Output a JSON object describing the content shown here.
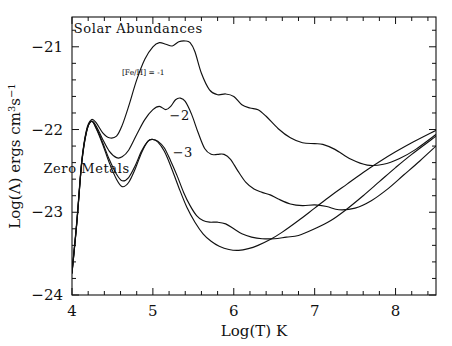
{
  "figure": {
    "title": "",
    "background": "#ffffff",
    "line_color": "#111111"
  },
  "axes": {
    "x": {
      "label": "Log(T)  K",
      "min": 4.0,
      "max": 8.5,
      "major_ticks": [
        4,
        5,
        6,
        7,
        8
      ],
      "tick_labels": [
        "4",
        "5",
        "6",
        "7",
        "8"
      ],
      "minor_tick_step": 0.2
    },
    "y": {
      "label_parts": {
        "prefix": "Log(",
        "lambda": "Λ",
        "middle": ") ergs cm",
        "sup1": "3",
        "s": "s",
        "sup2": "−1"
      },
      "label_plain": "Log(Λ) ergs cm3s−1",
      "min": -24.0,
      "max": -20.64,
      "major_ticks": [
        -21,
        -22,
        -23,
        -24
      ],
      "tick_labels": [
        "−21",
        "−22",
        "−23",
        "−24"
      ],
      "minor_tick_step": 0.2
    }
  },
  "annotations": [
    {
      "name": "solar-abundances-label",
      "text": "Solar Abundances",
      "x": 4.82,
      "y": -20.83,
      "size": 13
    },
    {
      "name": "feh-minus1-label",
      "text": "[Fe/H] = -1",
      "x": 4.88,
      "y": -21.34,
      "size": 7.5
    },
    {
      "name": "curve-label-minus2",
      "text": "−2",
      "x": 5.33,
      "y": -21.88,
      "size": 13
    },
    {
      "name": "curve-label-minus3",
      "text": "−3",
      "x": 5.37,
      "y": -22.33,
      "size": 13
    },
    {
      "name": "zero-metals-label",
      "text": "Zero Metals",
      "x": 4.18,
      "y": -22.52,
      "size": 13
    }
  ],
  "chart_data": {
    "type": "line",
    "title": "",
    "xlabel": "Log(T)  K",
    "ylabel": "Log(Λ) ergs cm3s−1",
    "xlim": [
      4.0,
      8.5
    ],
    "ylim": [
      -24.0,
      -20.64
    ],
    "grid": false,
    "legend": "inline-annotations",
    "series": [
      {
        "name": "Solar Abundances",
        "label": "Solar Abundances",
        "x": [
          4.0,
          4.06,
          4.12,
          4.18,
          4.24,
          4.3,
          4.38,
          4.46,
          4.55,
          4.62,
          4.7,
          4.8,
          4.9,
          5.0,
          5.08,
          5.16,
          5.24,
          5.32,
          5.4,
          5.46,
          5.52,
          5.6,
          5.7,
          5.8,
          5.9,
          6.0,
          6.1,
          6.2,
          6.3,
          6.4,
          6.55,
          6.7,
          6.85,
          7.0,
          7.1,
          7.25,
          7.45,
          7.65,
          7.85,
          8.05,
          8.25,
          8.5
        ],
        "y": [
          -23.72,
          -23.1,
          -22.38,
          -22.0,
          -21.88,
          -21.92,
          -22.04,
          -22.1,
          -22.08,
          -21.95,
          -21.72,
          -21.4,
          -21.15,
          -21.0,
          -20.95,
          -20.97,
          -20.99,
          -20.94,
          -20.93,
          -20.95,
          -21.06,
          -21.32,
          -21.52,
          -21.58,
          -21.57,
          -21.6,
          -21.7,
          -21.74,
          -21.76,
          -21.84,
          -21.99,
          -22.1,
          -22.16,
          -22.17,
          -22.18,
          -22.24,
          -22.36,
          -22.43,
          -22.42,
          -22.35,
          -22.24,
          -22.06
        ]
      },
      {
        "name": "[Fe/H] = -1",
        "label": "[Fe/H] = -1",
        "x": [
          4.0,
          4.06,
          4.12,
          4.18,
          4.24,
          4.3,
          4.38,
          4.46,
          4.55,
          4.62,
          4.7,
          4.8,
          4.9,
          5.0,
          5.08,
          5.16,
          5.22,
          5.28,
          5.34,
          5.4,
          5.48,
          5.56,
          5.64,
          5.72,
          5.8,
          5.88,
          5.96,
          6.05,
          6.15,
          6.25,
          6.35,
          6.45,
          6.55,
          6.7,
          6.85,
          7.0,
          7.15,
          7.3,
          7.5,
          7.7,
          7.9,
          8.1,
          8.3,
          8.5
        ],
        "y": [
          -23.73,
          -23.12,
          -22.4,
          -22.02,
          -21.9,
          -21.96,
          -22.12,
          -22.26,
          -22.34,
          -22.33,
          -22.25,
          -22.06,
          -21.88,
          -21.76,
          -21.72,
          -21.76,
          -21.72,
          -21.64,
          -21.62,
          -21.66,
          -21.82,
          -22.04,
          -22.23,
          -22.3,
          -22.3,
          -22.3,
          -22.36,
          -22.5,
          -22.64,
          -22.72,
          -22.76,
          -22.79,
          -22.84,
          -22.9,
          -22.92,
          -22.91,
          -22.93,
          -22.97,
          -22.95,
          -22.86,
          -22.72,
          -22.55,
          -22.38,
          -22.2
        ]
      },
      {
        "name": "[Fe/H] = -2",
        "label": "−2",
        "x": [
          4.0,
          4.06,
          4.12,
          4.18,
          4.24,
          4.3,
          4.38,
          4.46,
          4.55,
          4.62,
          4.7,
          4.78,
          4.86,
          4.94,
          5.0,
          5.06,
          5.14,
          5.22,
          5.3,
          5.38,
          5.46,
          5.54,
          5.62,
          5.7,
          5.8,
          5.9,
          6.0,
          6.1,
          6.22,
          6.35,
          6.5,
          6.65,
          6.8,
          7.0,
          7.2,
          7.4,
          7.6,
          7.8,
          8.0,
          8.2,
          8.5
        ],
        "y": [
          -23.73,
          -23.12,
          -22.4,
          -22.02,
          -21.9,
          -21.98,
          -22.16,
          -22.36,
          -22.54,
          -22.62,
          -22.58,
          -22.44,
          -22.26,
          -22.14,
          -22.12,
          -22.14,
          -22.22,
          -22.38,
          -22.56,
          -22.76,
          -22.92,
          -23.04,
          -23.1,
          -23.12,
          -23.12,
          -23.14,
          -23.2,
          -23.26,
          -23.3,
          -23.32,
          -23.32,
          -23.3,
          -23.28,
          -23.2,
          -23.1,
          -22.96,
          -22.8,
          -22.63,
          -22.46,
          -22.3,
          -22.08
        ]
      },
      {
        "name": "Zero Metals",
        "label": "Zero Metals / -3",
        "x": [
          4.0,
          4.06,
          4.12,
          4.18,
          4.24,
          4.3,
          4.38,
          4.46,
          4.55,
          4.62,
          4.7,
          4.78,
          4.86,
          4.94,
          5.0,
          5.06,
          5.14,
          5.22,
          5.32,
          5.42,
          5.52,
          5.62,
          5.72,
          5.82,
          5.94,
          6.06,
          6.18,
          6.3,
          6.45,
          6.6,
          6.8,
          7.0,
          7.2,
          7.4,
          7.6,
          7.8,
          8.0,
          8.2,
          8.5
        ],
        "y": [
          -23.74,
          -23.13,
          -22.41,
          -22.03,
          -21.9,
          -21.99,
          -22.18,
          -22.4,
          -22.6,
          -22.69,
          -22.64,
          -22.48,
          -22.28,
          -22.14,
          -22.12,
          -22.15,
          -22.26,
          -22.44,
          -22.7,
          -22.94,
          -23.12,
          -23.26,
          -23.35,
          -23.41,
          -23.45,
          -23.46,
          -23.44,
          -23.4,
          -23.33,
          -23.24,
          -23.1,
          -22.95,
          -22.8,
          -22.66,
          -22.52,
          -22.39,
          -22.27,
          -22.16,
          -22.01
        ]
      }
    ]
  }
}
